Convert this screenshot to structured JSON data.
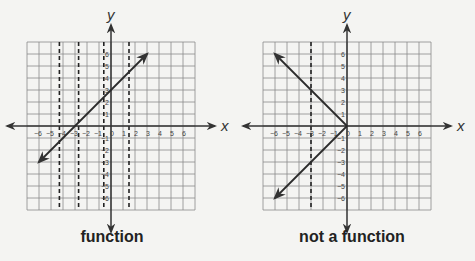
{
  "chart_data": [
    {
      "type": "line",
      "title": "function",
      "xlabel": "x",
      "ylabel": "y",
      "xlim": [
        -7,
        7
      ],
      "ylim": [
        -7,
        7
      ],
      "grid": true,
      "x_ticks": [
        -6,
        -5,
        -4,
        -3,
        -2,
        -1,
        0,
        1,
        2,
        3,
        4,
        5,
        6
      ],
      "y_ticks": [
        -6,
        -5,
        -4,
        -3,
        -2,
        -1,
        1,
        2,
        3,
        4,
        5,
        6
      ],
      "series": [
        {
          "name": "line",
          "x": [
            -6,
            3
          ],
          "y": [
            -3,
            6
          ],
          "arrows": "both"
        }
      ],
      "vertical_dashed_lines": [
        -4.3,
        -2.7,
        -0.6,
        1.5
      ],
      "annotation": "function"
    },
    {
      "type": "line",
      "title": "not a function",
      "xlabel": "x",
      "ylabel": "y",
      "xlim": [
        -7,
        7
      ],
      "ylim": [
        -7,
        7
      ],
      "grid": true,
      "x_ticks": [
        -6,
        -5,
        -4,
        -3,
        -2,
        -1,
        0,
        1,
        2,
        3,
        4,
        5,
        6
      ],
      "y_ticks": [
        -6,
        -5,
        -4,
        -3,
        -2,
        -1,
        1,
        2,
        3,
        4,
        5,
        6
      ],
      "series": [
        {
          "name": "upper ray",
          "x": [
            0,
            -6
          ],
          "y": [
            0,
            6
          ],
          "arrows": "end"
        },
        {
          "name": "lower ray",
          "x": [
            0,
            -6
          ],
          "y": [
            0,
            -6
          ],
          "arrows": "end"
        }
      ],
      "vertical_dashed_lines": [
        -3
      ],
      "annotation": "not a function"
    }
  ],
  "labels": {
    "left_caption": "function",
    "right_caption": "not a function",
    "x_axis": "x",
    "y_axis": "y"
  },
  "colors": {
    "grid": "#8a8a8a",
    "axis": "#333333",
    "line": "#2b2b2b",
    "background": "#f4f4f2"
  }
}
